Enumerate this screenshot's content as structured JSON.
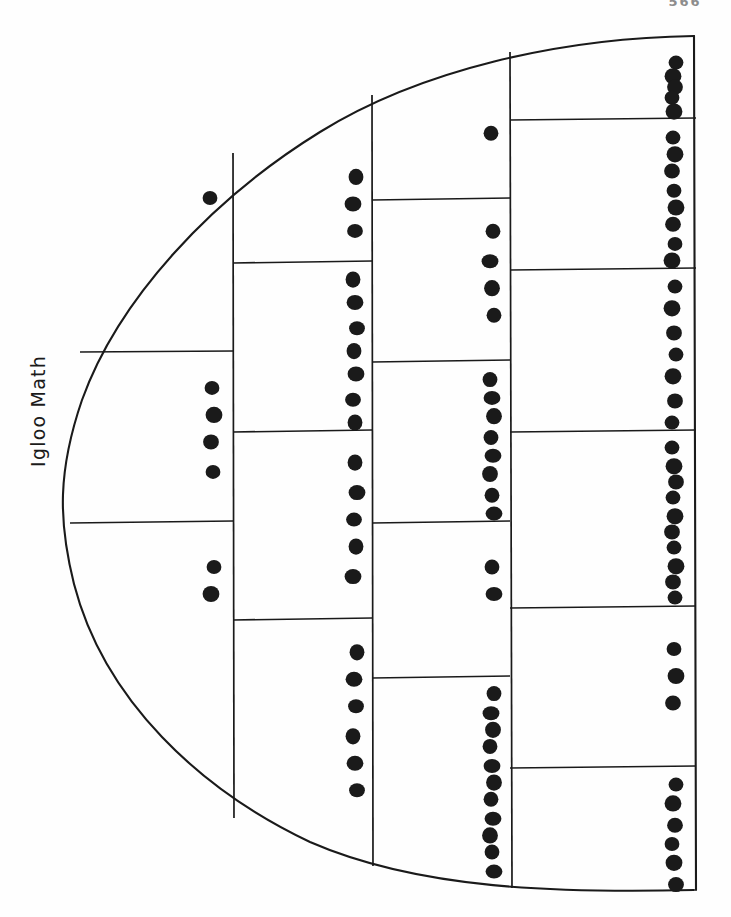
{
  "page": {
    "title": "Igloo Math",
    "page_number": "566",
    "ink_color": "#1a1a1a",
    "paper_color": "#fefefe",
    "width": 731,
    "height": 917
  },
  "label": {
    "text": "Igloo Math",
    "orientation": "vertical-rotated-90-ccw",
    "x": 48,
    "y": 460
  },
  "chart_data": {
    "type": "table",
    "title": "Igloo Math",
    "xlabel": "",
    "ylabel": "",
    "grid": true,
    "legend": false,
    "outline": {
      "shape": "half-dome",
      "apex_x": 694,
      "apex_top_y": 36,
      "apex_bottom_y": 890,
      "leftmost_x": 66
    },
    "column_boundaries": [
      233,
      372,
      510,
      694
    ],
    "columns": [
      {
        "name": "column-1",
        "x_left": 66,
        "x_right": 233,
        "dot_x": 212,
        "cells": [
          {
            "label": "c1r1",
            "top": 155,
            "bottom": 352,
            "dots": 1
          },
          {
            "label": "c1r2",
            "top": 352,
            "bottom": 523,
            "dots": 4
          },
          {
            "label": "c1r3",
            "top": 523,
            "bottom": 800,
            "dots": 2
          }
        ],
        "total": 7
      },
      {
        "name": "column-2",
        "x_left": 233,
        "x_right": 372,
        "dot_x": 355,
        "cells": [
          {
            "label": "c2r1",
            "top": 150,
            "bottom": 263,
            "dots": 3
          },
          {
            "label": "c2r2",
            "top": 263,
            "bottom": 432,
            "dots": 7
          },
          {
            "label": "c2r3",
            "top": 432,
            "bottom": 620,
            "dots": 5
          },
          {
            "label": "c2r4",
            "top": 620,
            "bottom": 835,
            "dots": 6
          }
        ],
        "total": 21
      },
      {
        "name": "column-3",
        "x_left": 372,
        "x_right": 510,
        "dot_x": 492,
        "cells": [
          {
            "label": "c3r1",
            "top": 92,
            "bottom": 200,
            "dots": 1
          },
          {
            "label": "c3r2",
            "top": 200,
            "bottom": 362,
            "dots": 4
          },
          {
            "label": "c3r3",
            "top": 362,
            "bottom": 523,
            "dots": 8
          },
          {
            "label": "c3r4",
            "top": 523,
            "bottom": 678,
            "dots": 2
          },
          {
            "label": "c3r5",
            "top": 678,
            "bottom": 880,
            "dots": 11
          }
        ],
        "total": 26
      },
      {
        "name": "column-4",
        "x_left": 510,
        "x_right": 694,
        "dot_x": 674,
        "cells": [
          {
            "label": "c4r1",
            "top": 47,
            "bottom": 120,
            "dots": 5
          },
          {
            "label": "c4r2",
            "top": 120,
            "bottom": 270,
            "dots": 8
          },
          {
            "label": "c4r3",
            "top": 270,
            "bottom": 432,
            "dots": 7
          },
          {
            "label": "c4r4",
            "top": 432,
            "bottom": 608,
            "dots": 10
          },
          {
            "label": "c4r5",
            "top": 608,
            "bottom": 768,
            "dots": 3
          },
          {
            "label": "c4r6",
            "top": 768,
            "bottom": 893,
            "dots": 6
          }
        ],
        "total": 39
      }
    ],
    "dot_totals_by_column": [
      7,
      21,
      26,
      39
    ],
    "grand_total": 93
  }
}
